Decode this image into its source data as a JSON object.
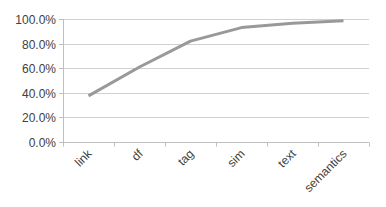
{
  "chart_data": {
    "type": "line",
    "title": "",
    "xlabel": "",
    "ylabel": "",
    "categories": [
      "link",
      "df",
      "tag",
      "sim",
      "text",
      "semantics"
    ],
    "series": [
      {
        "name": "Series1",
        "values": [
          37.5,
          61.0,
          82.0,
          93.0,
          96.5,
          98.5
        ],
        "color": "#999999"
      }
    ],
    "ylim": [
      0,
      100
    ],
    "yticks": [
      0,
      20,
      40,
      60,
      80,
      100
    ],
    "ytick_labels": [
      "0.0%",
      "20.0%",
      "40.0%",
      "60.0%",
      "80.0%",
      "100.0%"
    ],
    "grid": true,
    "legend": "none",
    "xtick_rotation": -45
  }
}
